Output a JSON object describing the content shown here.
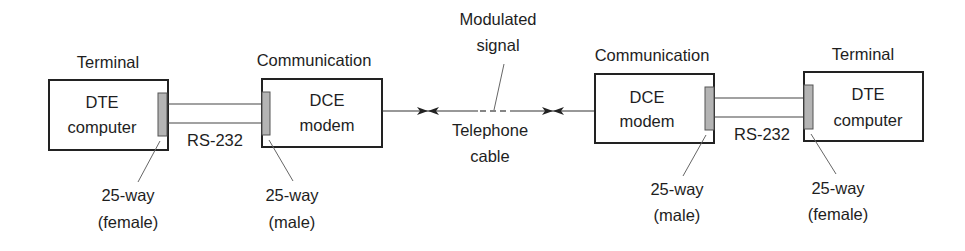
{
  "diagram": {
    "left_terminal": {
      "caption": "Terminal",
      "line1": "DTE",
      "line2": "computer",
      "connector": {
        "line1": "25-way",
        "line2": "(female)"
      }
    },
    "left_modem": {
      "caption": "Communication",
      "line1": "DCE",
      "line2": "modem",
      "connector": {
        "line1": "25-way",
        "line2": "(male)"
      }
    },
    "right_modem": {
      "caption": "Communication",
      "line1": "DCE",
      "line2": "modem",
      "connector": {
        "line1": "25-way",
        "line2": "(male)"
      }
    },
    "right_terminal": {
      "caption": "Terminal",
      "line1": "DTE",
      "line2": "computer",
      "connector": {
        "line1": "25-way",
        "line2": "(female)"
      }
    },
    "left_cable_label": "RS-232",
    "right_cable_label": "RS-232",
    "signal_label": {
      "line1": "Modulated",
      "line2": "signal"
    },
    "telephone_label": {
      "line1": "Telephone",
      "line2": "cable"
    }
  }
}
